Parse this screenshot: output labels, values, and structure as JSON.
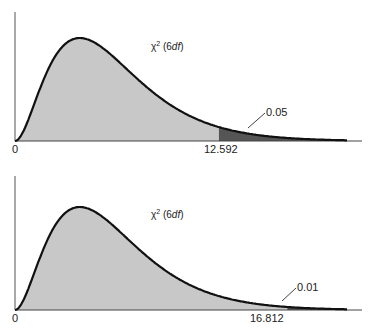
{
  "chart_data": [
    {
      "type": "area",
      "title": "",
      "distribution": "chi-square",
      "df": 6,
      "curve_label": "χ² (6df)",
      "xlabel": "",
      "ylabel": "",
      "x_ticks": [
        "0",
        "12.592"
      ],
      "critical_value": 12.592,
      "tail_area": 0.05,
      "tail_label": "0.05",
      "regions": [
        {
          "name": "acceptance",
          "from": 0,
          "to": 12.592,
          "color": "#c8c8c8"
        },
        {
          "name": "rejection-tail",
          "from": 12.592,
          "to": 20.5,
          "color": "#555555"
        }
      ],
      "grid": false,
      "legend": "none"
    },
    {
      "type": "area",
      "title": "",
      "distribution": "chi-square",
      "df": 6,
      "curve_label": "χ² (6df)",
      "xlabel": "",
      "ylabel": "",
      "x_ticks": [
        "0",
        "16.812"
      ],
      "critical_value": 16.812,
      "tail_area": 0.01,
      "tail_label": "0.01",
      "regions": [
        {
          "name": "acceptance",
          "from": 0,
          "to": 16.812,
          "color": "#c8c8c8"
        },
        {
          "name": "rejection-tail",
          "from": 16.812,
          "to": 20.5,
          "color": "#555555"
        }
      ],
      "grid": false,
      "legend": "none"
    }
  ],
  "panels": [
    {
      "zero": "0",
      "crit": "12.592",
      "tail": "0.05",
      "chi": "χ",
      "sup": "2",
      "df_open": "(6",
      "df_txt": "df",
      "df_close": ")"
    },
    {
      "zero": "0",
      "crit": "16.812",
      "tail": "0.01",
      "chi": "χ",
      "sup": "2",
      "df_open": "(6",
      "df_txt": "df",
      "df_close": ")"
    }
  ],
  "colors": {
    "fill": "#c8c8c8",
    "tail": "#555555",
    "curve": "#111111",
    "axis": "#444444"
  }
}
